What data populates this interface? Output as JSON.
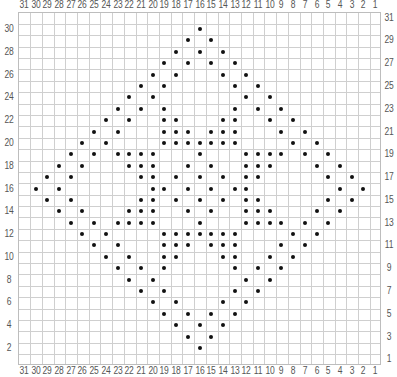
{
  "chart_data": {
    "type": "table",
    "title": "",
    "columns": 31,
    "rows": 31,
    "column_labels_top": [
      31,
      30,
      29,
      28,
      27,
      26,
      25,
      24,
      23,
      22,
      21,
      20,
      19,
      18,
      17,
      16,
      15,
      14,
      13,
      12,
      11,
      10,
      9,
      8,
      7,
      6,
      5,
      4,
      3,
      2,
      1
    ],
    "column_labels_bottom": [
      31,
      30,
      29,
      28,
      27,
      26,
      25,
      24,
      23,
      22,
      21,
      20,
      19,
      18,
      17,
      16,
      15,
      14,
      13,
      12,
      11,
      10,
      9,
      8,
      7,
      6,
      5,
      4,
      3,
      2,
      1
    ],
    "row_labels_left": [
      30,
      28,
      26,
      24,
      22,
      20,
      18,
      16,
      14,
      12,
      10,
      8,
      6,
      4,
      2
    ],
    "row_labels_right": [
      31,
      29,
      27,
      25,
      23,
      21,
      19,
      17,
      15,
      13,
      11,
      9,
      7,
      5,
      3,
      1
    ],
    "dots_by_row": {
      "31": [],
      "30": [
        16
      ],
      "29": [
        17,
        15
      ],
      "28": [
        18,
        16,
        14
      ],
      "27": [
        19,
        17,
        15,
        13
      ],
      "26": [
        20,
        18,
        14,
        12
      ],
      "25": [
        21,
        19,
        13,
        11
      ],
      "24": [
        22,
        20,
        12,
        10
      ],
      "23": [
        23,
        21,
        19,
        13,
        11,
        9
      ],
      "22": [
        24,
        22,
        19,
        18,
        14,
        13,
        10,
        8
      ],
      "21": [
        25,
        23,
        19,
        18,
        17,
        15,
        14,
        13,
        9,
        7
      ],
      "20": [
        26,
        24,
        19,
        18,
        17,
        16,
        15,
        14,
        13,
        8,
        6
      ],
      "19": [
        27,
        25,
        23,
        22,
        21,
        20,
        16,
        12,
        11,
        10,
        9,
        7,
        5
      ],
      "18": [
        28,
        26,
        22,
        21,
        20,
        17,
        15,
        12,
        11,
        10,
        6,
        4
      ],
      "17": [
        29,
        27,
        21,
        20,
        18,
        16,
        14,
        12,
        11,
        5,
        3
      ],
      "16": [
        30,
        28,
        20,
        19,
        17,
        15,
        13,
        12,
        4,
        2
      ],
      "15": [
        29,
        27,
        21,
        20,
        18,
        16,
        14,
        12,
        11,
        5,
        3
      ],
      "14": [
        28,
        26,
        22,
        21,
        20,
        17,
        15,
        12,
        11,
        10,
        6,
        4
      ],
      "13": [
        27,
        25,
        23,
        22,
        21,
        20,
        16,
        12,
        11,
        10,
        9,
        7,
        5
      ],
      "12": [
        26,
        24,
        19,
        18,
        17,
        16,
        15,
        14,
        13,
        8,
        6
      ],
      "11": [
        25,
        23,
        19,
        18,
        17,
        15,
        14,
        13,
        9,
        7
      ],
      "10": [
        24,
        22,
        19,
        18,
        14,
        13,
        10,
        8
      ],
      "9": [
        23,
        21,
        19,
        13,
        11,
        9
      ],
      "8": [
        22,
        20,
        12,
        10
      ],
      "7": [
        21,
        19,
        13,
        11
      ],
      "6": [
        20,
        18,
        14,
        12
      ],
      "5": [
        19,
        17,
        15,
        13
      ],
      "4": [
        18,
        16,
        14
      ],
      "3": [
        17,
        15
      ],
      "2": [
        16
      ],
      "1": []
    },
    "grid": true
  },
  "colors": {
    "grid_line": "#cfcfcf",
    "grid_border": "#bdbdbd",
    "dot": "#111111",
    "label": "#555555",
    "background": "#ffffff"
  }
}
